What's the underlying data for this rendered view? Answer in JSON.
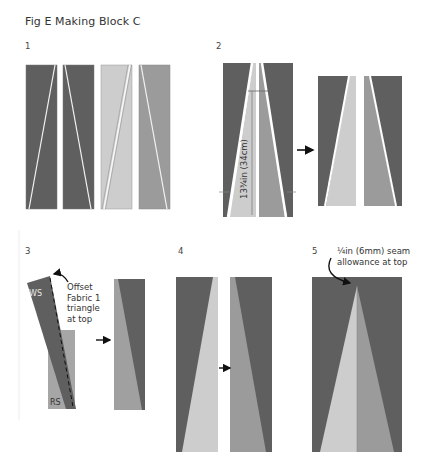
{
  "figure": {
    "title": "Fig E Making Block C",
    "colors": {
      "dark": "#5f5f5f",
      "medium": "#9b9b9b",
      "light": "#cdcdcd",
      "seam": "#f2f2f2",
      "arrow": "#111111"
    }
  },
  "steps": [
    {
      "number": "1"
    },
    {
      "number": "2",
      "measurement": "13¾in (34cm)"
    },
    {
      "number": "3",
      "note": [
        "Offset",
        "Fabric 1",
        "triangle",
        "at top"
      ],
      "label_ws": "WS",
      "label_rs": "RS"
    },
    {
      "number": "4"
    },
    {
      "number": "5",
      "note": [
        "¼in (6mm) seam",
        "allowance at top"
      ]
    }
  ]
}
